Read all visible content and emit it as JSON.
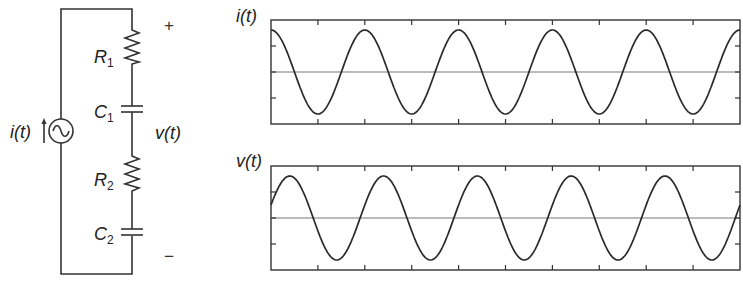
{
  "circuit": {
    "source_label": "i(t)",
    "components": [
      {
        "name": "R",
        "sub": "1",
        "type": "resistor"
      },
      {
        "name": "C",
        "sub": "1",
        "type": "capacitor"
      },
      {
        "name": "R",
        "sub": "2",
        "type": "resistor"
      },
      {
        "name": "C",
        "sub": "2",
        "type": "capacitor"
      }
    ],
    "voltage_label": "v(t)",
    "plus_sign": "+",
    "minus_sign": "−",
    "source_icon": "ac-current-source-icon"
  },
  "chart_data": [
    {
      "type": "line",
      "title": "i(t)",
      "ylabel": "i(t)",
      "xlabel": "",
      "grid": false,
      "x_ticks": 10,
      "y_ticks": 3,
      "series": [
        {
          "name": "i(t)",
          "shape": "cosine",
          "amplitude": 1,
          "periods_shown": 5,
          "phase_deg": 0
        }
      ],
      "ylim": [
        -1.2,
        1.2
      ]
    },
    {
      "type": "line",
      "title": "v(t)",
      "ylabel": "v(t)",
      "xlabel": "",
      "grid": false,
      "x_ticks": 10,
      "y_ticks": 3,
      "series": [
        {
          "name": "v(t)",
          "shape": "cosine",
          "amplitude": 1,
          "periods_shown": 5,
          "phase_deg": -72
        }
      ],
      "ylim": [
        -1.2,
        1.2
      ]
    }
  ]
}
